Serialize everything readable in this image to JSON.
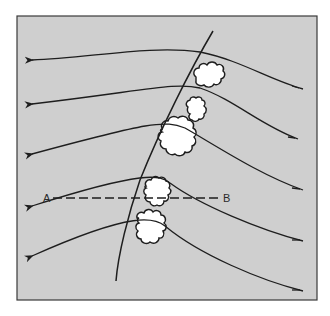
{
  "diagram": {
    "type": "weather-front-schematic",
    "colors": {
      "background": "#cfcfcf",
      "frame": "#3a3a3a",
      "line": "#1e1e1e",
      "cloud_fill": "#ffffff",
      "page": "#ffffff"
    },
    "labels": {
      "section_start": "A",
      "section_end": "B"
    },
    "elements": {
      "front_line": "curved front line running from top-right to bottom-left",
      "streamlines": 6,
      "streamline_direction": "right to left (arrowheads on left ends, tick marks on right ends)",
      "clouds": 5,
      "cross_section": "dashed line A–B"
    }
  }
}
